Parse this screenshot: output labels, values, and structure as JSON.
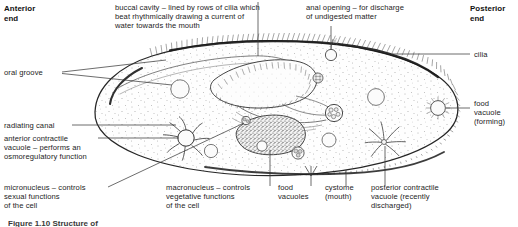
{
  "figure": {
    "organism": "Paramecium",
    "caption_partial": "Figure 1.10  Structure of"
  },
  "orientation": {
    "anterior": "Anterior\nend",
    "posterior": "Posterior\nend"
  },
  "labels": {
    "buccal_cavity": "buccal cavity – lined by rows of cilia which\nbeat rhythmically drawing a current of\nwater towards the mouth",
    "anal_opening": "anal opening – for discharge\nof undigested matter",
    "oral_groove": "oral groove",
    "radiating_canal": "radiating canal",
    "anterior_contractile_vacuole": "anterior contractile\nvacuole – performs an\nosmoregulatory function",
    "micronucleus": "micronucleus – controls\nsexual functions\nof the cell",
    "macronucleus": "macronucleus – controls\nvegetative functions\nof the cell",
    "food_vacuoles": "food\nvacuoles",
    "cystome": "cystome\n(mouth)",
    "posterior_contractile_vacuole": "posterior contractile\nvacuole (recently\ndischarged)",
    "cilia": "cilia",
    "food_vacuole_forming": "food\nvacuole\n(forming)"
  },
  "colors": {
    "ink": "#242424",
    "leader_line": "#3b3b3b",
    "cell_fill": "#fdfdfd",
    "membrane": "#2a2a2a",
    "stipple": "#555555",
    "macronucleus_fill": "#9a9a9a"
  }
}
